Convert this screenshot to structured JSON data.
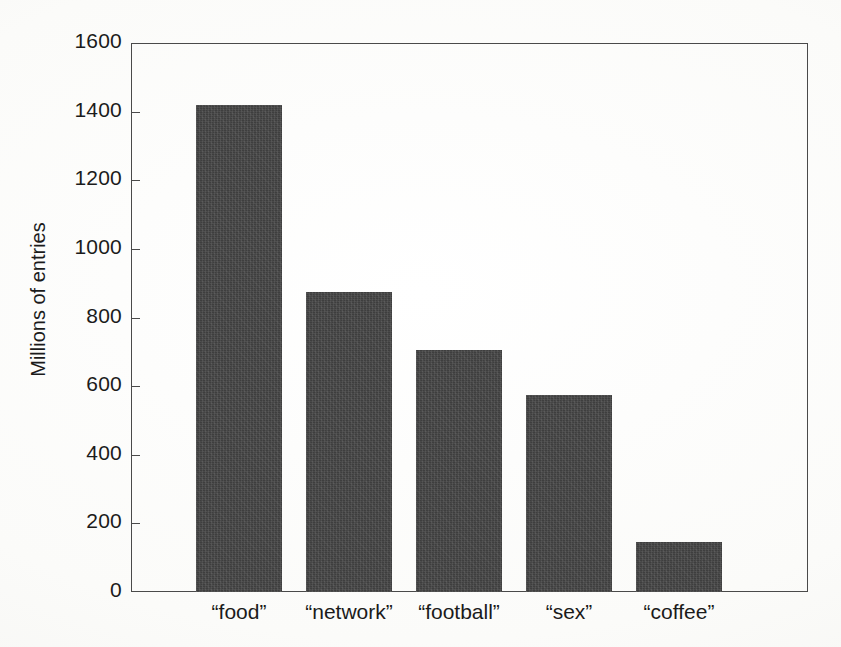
{
  "chart_data": {
    "type": "bar",
    "title": "",
    "subtitle": "",
    "xlabel": "",
    "ylabel": "Millions of entries",
    "categories": [
      "“food”",
      "“network”",
      "“football”",
      "“sex”",
      "“coffee”"
    ],
    "values": [
      1420,
      875,
      705,
      575,
      145
    ],
    "ylim": [
      0,
      1600
    ],
    "ytick_labels": [
      "0",
      "200",
      "400",
      "600",
      "800",
      "1000",
      "1200",
      "1400",
      "1600"
    ],
    "ytick_values": [
      0,
      200,
      400,
      600,
      800,
      1000,
      1200,
      1400,
      1600
    ],
    "ytick_step": 200,
    "xtick_labels": [
      "“food”",
      "“network”",
      "“football”",
      "“sex”",
      "“coffee”"
    ],
    "grid": false,
    "legend": false,
    "legend_position": "none",
    "bar_color": "#3e3e3e",
    "axis_color": "#4a4a4a",
    "background_color": "#fdfdfb",
    "annotations": []
  }
}
